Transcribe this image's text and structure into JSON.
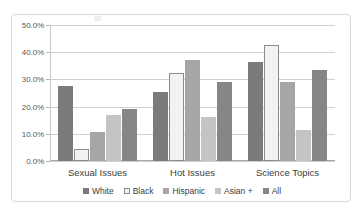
{
  "chart_data": {
    "type": "bar",
    "title": "",
    "subtitle": "",
    "xlabel": "",
    "ylabel": "",
    "categories": [
      "Sexual Issues",
      "Hot Issues",
      "Science Topics"
    ],
    "series": [
      {
        "name": "White",
        "values": [
          27.5,
          25.2,
          36.5
        ],
        "color": "#7b7b7b"
      },
      {
        "name": "Black",
        "values": [
          4.5,
          32.2,
          42.5
        ],
        "color": "#f2f2f2"
      },
      {
        "name": "Hispanic",
        "values": [
          10.8,
          37.2,
          29.0
        ],
        "color": "#a6a6a6"
      },
      {
        "name": "Asian +",
        "values": [
          17.0,
          16.0,
          11.5
        ],
        "color": "#c4c4c4"
      },
      {
        "name": "All",
        "values": [
          19.0,
          29.0,
          33.5
        ],
        "color": "#868686"
      }
    ],
    "ylim": [
      0,
      50
    ],
    "ytick_values": [
      0,
      10,
      20,
      30,
      40,
      50
    ],
    "ytick_labels": [
      "0.0%",
      "10.0%",
      "20.0%",
      "30.0%",
      "40.0%",
      "50.0%"
    ],
    "grid": true,
    "legend_position": "bottom",
    "value_format": "percent"
  },
  "colors": {
    "frame_border": "#d8d8d8",
    "gridline": "#d0d0d0",
    "axis": "#a8a8a8",
    "tick_text": "#595959",
    "category_text": "#404040",
    "legend_text": "#3d3d3d",
    "black_series_border": "#8c8c8c",
    "background": "#ffffff"
  }
}
